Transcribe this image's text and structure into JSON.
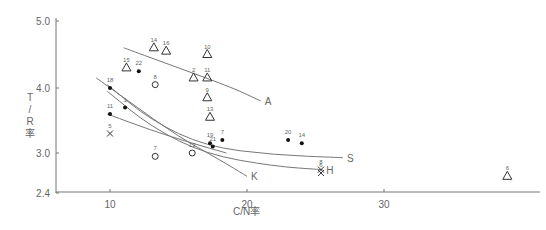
{
  "chart_data": {
    "type": "scatter",
    "title": "",
    "xlabel": "C/N率",
    "ylabel": "T/R率",
    "xlim": [
      6,
      40
    ],
    "ylim": [
      2.4,
      5.0
    ],
    "x_ticks": [
      "10",
      "20",
      "30"
    ],
    "y_ticks": [
      "2.4",
      "3.0",
      "4.0",
      "5.0"
    ],
    "grid": false,
    "legend": "curve end labels",
    "series": [
      {
        "name": "A",
        "marker": "triangle",
        "points": [
          {
            "label": "14",
            "x": 13.2,
            "y": 4.6
          },
          {
            "label": "16",
            "x": 14.1,
            "y": 4.55
          },
          {
            "label": "10",
            "x": 17.1,
            "y": 4.5
          },
          {
            "label": "15",
            "x": 11.2,
            "y": 4.3
          },
          {
            "label": "2",
            "x": 16.1,
            "y": 4.15
          },
          {
            "label": "11",
            "x": 17.1,
            "y": 4.15
          },
          {
            "label": "9",
            "x": 17.1,
            "y": 3.85
          },
          {
            "label": "13",
            "x": 17.3,
            "y": 3.55
          },
          {
            "label": "6",
            "x": 39.0,
            "y": 2.65
          }
        ]
      },
      {
        "name": "S",
        "marker": "filled-circle",
        "points": [
          {
            "label": "22",
            "x": 12.1,
            "y": 4.25
          },
          {
            "label": "18",
            "x": 10.0,
            "y": 4.0
          },
          {
            "label": "11",
            "x": 10.0,
            "y": 3.6
          },
          {
            "label": "1",
            "x": 11.1,
            "y": 3.7
          },
          {
            "label": "20",
            "x": 23.0,
            "y": 3.2
          },
          {
            "label": "14",
            "x": 24.0,
            "y": 3.15
          },
          {
            "label": "7",
            "x": 18.2,
            "y": 3.2
          },
          {
            "label": "19",
            "x": 17.3,
            "y": 3.15
          },
          {
            "label": "21",
            "x": 17.5,
            "y": 3.1
          }
        ]
      },
      {
        "name": "H",
        "marker": "cross",
        "points": [
          {
            "label": "5",
            "x": 10.0,
            "y": 3.3
          },
          {
            "label": "8",
            "x": 25.4,
            "y": 2.75
          },
          {
            "label": "6",
            "x": 25.4,
            "y": 2.7
          }
        ]
      },
      {
        "name": "K",
        "marker": "open-circle",
        "points": [
          {
            "label": "8",
            "x": 13.3,
            "y": 4.05
          },
          {
            "label": "7",
            "x": 13.3,
            "y": 2.95
          },
          {
            "label": "12",
            "x": 16.0,
            "y": 3.0
          }
        ]
      }
    ],
    "curves": [
      {
        "name": "A",
        "label": "A",
        "points": [
          [
            11.0,
            4.6
          ],
          [
            15.0,
            4.3
          ],
          [
            19.0,
            4.0
          ],
          [
            21.0,
            3.8
          ]
        ]
      },
      {
        "name": "S",
        "label": "S",
        "points": [
          [
            9.8,
            4.05
          ],
          [
            13.0,
            3.5
          ],
          [
            17.0,
            3.1
          ],
          [
            22.0,
            2.97
          ],
          [
            27.0,
            2.93
          ]
        ]
      },
      {
        "name": "H",
        "label": "H",
        "points": [
          [
            9.8,
            3.95
          ],
          [
            13.0,
            3.4
          ],
          [
            17.0,
            2.98
          ],
          [
            22.0,
            2.8
          ],
          [
            25.5,
            2.75
          ]
        ]
      },
      {
        "name": "K",
        "label": "K",
        "points": [
          [
            9.0,
            4.15
          ],
          [
            12.0,
            3.7
          ],
          [
            15.0,
            3.25
          ],
          [
            18.0,
            2.9
          ],
          [
            20.0,
            2.65
          ]
        ]
      },
      {
        "name": "L",
        "label": "",
        "points": [
          [
            9.8,
            3.6
          ],
          [
            13.0,
            3.35
          ],
          [
            16.0,
            3.15
          ],
          [
            18.5,
            3.0
          ]
        ]
      }
    ]
  }
}
